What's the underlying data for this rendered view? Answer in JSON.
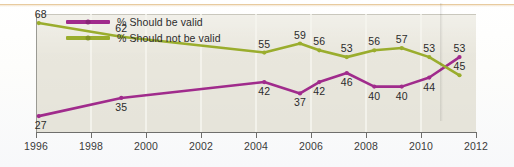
{
  "chart_data": {
    "type": "line",
    "title": "",
    "subtitle": "",
    "xlabel": "",
    "ylabel": "",
    "xlim": [
      1996,
      2012
    ],
    "ylim": [
      20,
      72
    ],
    "grid": "vertical-only",
    "legend_position": "top-left-inside",
    "xticks": [
      "1996",
      "1998",
      "2000",
      "2002",
      "2004",
      "2006",
      "2008",
      "2010",
      "2012"
    ],
    "x": [
      1996.1,
      1999.1,
      2004.3,
      2005.6,
      2006.3,
      2007.3,
      2008.3,
      2009.3,
      2010.3,
      2011.4
    ],
    "series": [
      {
        "name": "% Should be valid",
        "color": "#a02b8c",
        "label_position": "below",
        "values": [
          27,
          35,
          42,
          37,
          42,
          46,
          40,
          40,
          44,
          53
        ],
        "labels": [
          "27",
          "35",
          "42",
          "37",
          "42",
          "46",
          "40",
          "40",
          "44",
          "53"
        ]
      },
      {
        "name": "% Should not be valid",
        "color": "#9aad2d",
        "label_position": "above",
        "values": [
          68,
          62,
          55,
          59,
          56,
          53,
          56,
          57,
          53,
          45
        ],
        "labels": [
          "68",
          "62",
          "55",
          "59",
          "56",
          "53",
          "56",
          "57",
          "53",
          "45"
        ]
      }
    ]
  },
  "legend": {
    "items": [
      {
        "label": "% Should be valid",
        "color": "#a02b8c"
      },
      {
        "label": "% Should not be valid",
        "color": "#9aad2d"
      }
    ]
  },
  "colors": {
    "purple": "#a02b8c",
    "green": "#9aad2d",
    "plot_background": "#eae8de",
    "gridline": "#f6f5ef",
    "axis": "#6f6f6c",
    "page_rule": "#e7c89a",
    "text": "#2b2b2b"
  }
}
